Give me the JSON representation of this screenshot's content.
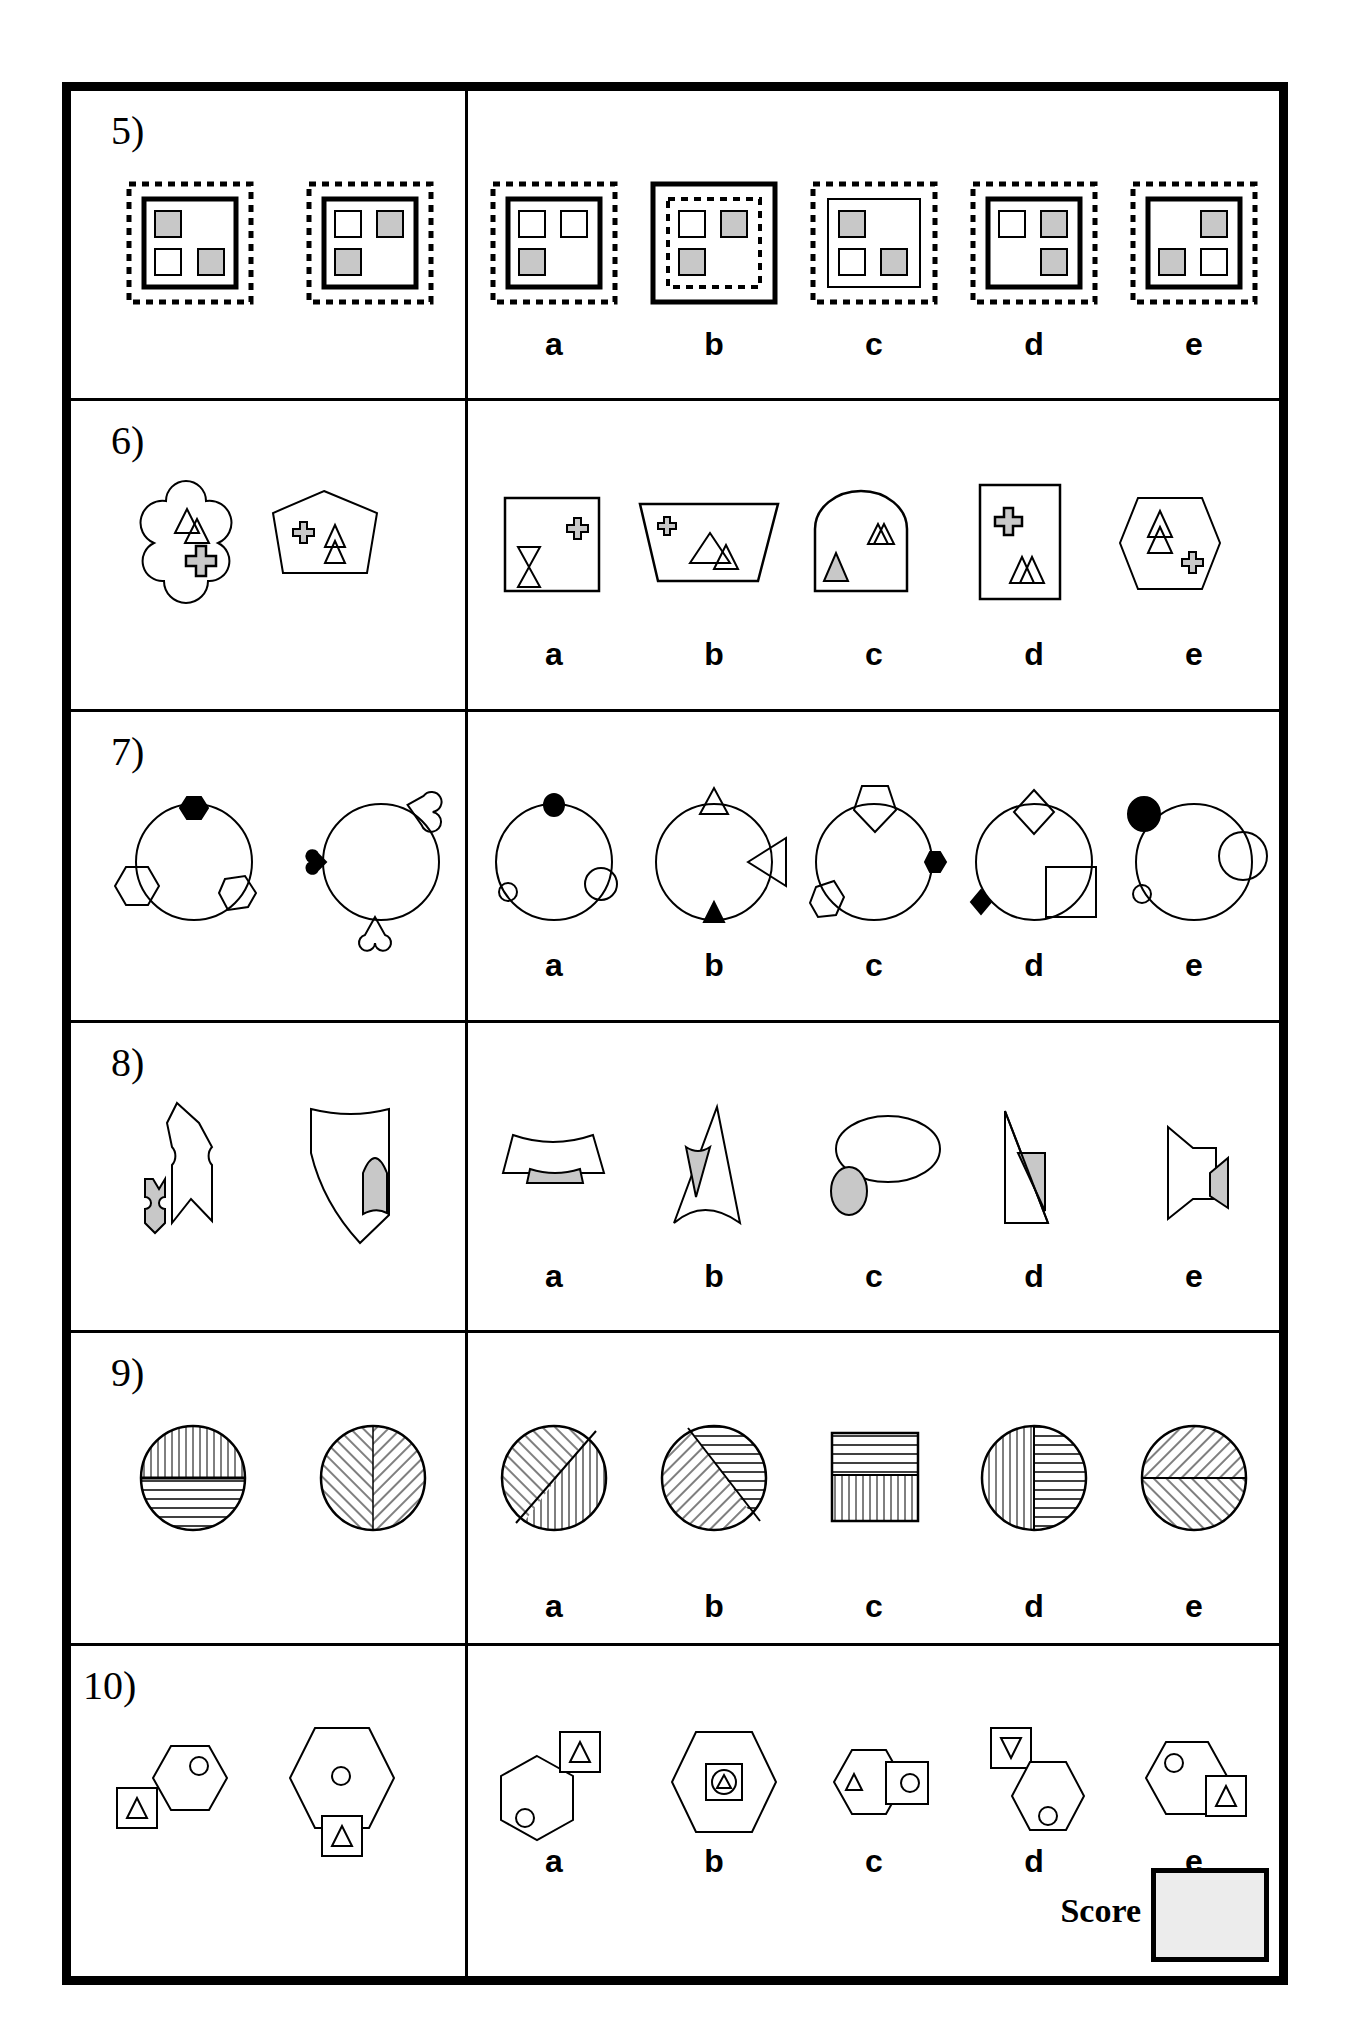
{
  "worksheet": {
    "title": "Shape analogy reasoning worksheet",
    "option_labels": [
      "a",
      "b",
      "c",
      "d",
      "e"
    ],
    "questions": [
      {
        "number": "5)",
        "description": "Square frames with dotted/solid borders containing three small squares (gray or white)",
        "example_pair": [
          "dotted outer, solid inner, gray top-left, white bottom-left, gray bottom-right",
          "dotted outer, solid inner, white top-left, gray top-right, gray bottom-left"
        ],
        "options": [
          "a",
          "b",
          "c",
          "d",
          "e"
        ]
      },
      {
        "number": "6)",
        "description": "Outer shapes containing overlapping triangles and a gray cross",
        "example_pair": [
          "cloud with two triangles and cross",
          "pentagon with cross and two triangles"
        ],
        "options": [
          "a",
          "b",
          "c",
          "d",
          "e"
        ]
      },
      {
        "number": "7)",
        "description": "Circles with small shapes on their perimeter",
        "example_pair": [
          "circle with black hexagon and two hexagons",
          "circle with black heart and two hearts"
        ],
        "options": [
          "a",
          "b",
          "c",
          "d",
          "e"
        ]
      },
      {
        "number": "8)",
        "description": "Outline shapes with a gray shape attached",
        "example_pair": [
          "arrow shape with gray arrow",
          "shield with gray arch"
        ],
        "options": [
          "a",
          "b",
          "c",
          "d",
          "e"
        ]
      },
      {
        "number": "9)",
        "description": "Circles split into hatched halves",
        "example_pair": [
          "vertical top, horizontal bottom",
          "chevron diagonal hatch"
        ],
        "options": [
          "a",
          "b",
          "c",
          "d",
          "e"
        ]
      },
      {
        "number": "10)",
        "description": "Hexagons with circle and square containing triangle",
        "example_pair": [
          "hexagon with circle, square with triangle lower-left",
          "large hexagon with circle, square with triangle below"
        ],
        "options": [
          "a",
          "b",
          "c",
          "d",
          "e"
        ]
      }
    ],
    "score": {
      "label": "Score",
      "value": ""
    }
  },
  "colors": {
    "ink": "#000000",
    "fill_gray": "#c8c8c8",
    "score_fill": "#ececec"
  }
}
